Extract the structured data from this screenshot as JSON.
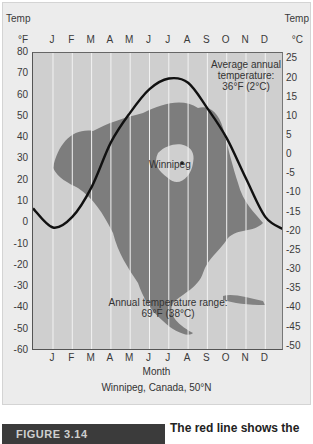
{
  "header": {
    "left_title": "Temp",
    "right_title": "Temp",
    "left_unit": "°F",
    "right_unit": "°C"
  },
  "months": [
    "J",
    "F",
    "M",
    "A",
    "M",
    "J",
    "J",
    "A",
    "S",
    "O",
    "N",
    "D"
  ],
  "axis_left_ticks": [
    "80",
    "70",
    "60",
    "50",
    "40",
    "30",
    "20",
    "10",
    "0",
    "-10",
    "-20",
    "-30",
    "-40",
    "-50",
    "-60"
  ],
  "axis_right_ticks": [
    "25",
    "20",
    "15",
    "10",
    "5",
    "0",
    "-5",
    "-10",
    "-15",
    "-20",
    "-25",
    "-30",
    "-35",
    "-40",
    "-45",
    "-50"
  ],
  "annotations": {
    "avg_line1": "Average annual",
    "avg_line2": "temperature:",
    "avg_line3": "36°F (2°C)",
    "city": "Winnipeg",
    "range_line1": "Annual temperature range:",
    "range_line2": "69°F (38°C)"
  },
  "xlabel": "Month",
  "caption": "Winnipeg, Canada, 50°N",
  "figure": {
    "tab_label": "FIGURE 3.14",
    "text": "The red line shows the"
  },
  "colors": {
    "plot_bg": "#cfcfcf",
    "curve": "#111111",
    "panel": "#ececec",
    "tab": "#3b3b3b"
  },
  "chart_data": {
    "type": "line",
    "title": "Winnipeg, Canada, 50°N",
    "xlabel": "Month",
    "ylabel": "Temp (°F)",
    "ylabel_right": "Temp (°C)",
    "categories": [
      "J",
      "F",
      "M",
      "A",
      "M",
      "J",
      "J",
      "A",
      "S",
      "O",
      "N",
      "D"
    ],
    "series": [
      {
        "name": "Monthly mean temperature (°F)",
        "values": [
          -2,
          3,
          17,
          38,
          52,
          63,
          68,
          66,
          54,
          40,
          21,
          3
        ]
      }
    ],
    "ylim": [
      -60,
      80
    ],
    "ylim_right": [
      -50,
      25
    ],
    "grid": "vertical month lines",
    "annotations": [
      "Average annual temperature: 36°F (2°C)",
      "Annual temperature range: 69°F (38°C)",
      "Winnipeg"
    ]
  }
}
